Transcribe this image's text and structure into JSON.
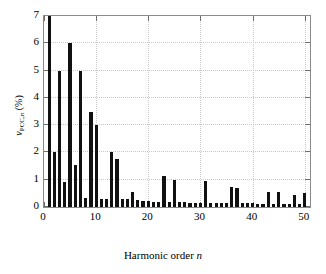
{
  "chart_data": {
    "type": "bar",
    "title": "",
    "xlabel_main": "Harmonic order",
    "xlabel_italic": "n",
    "ylabel_main": "v",
    "ylabel_sub": "PCC,",
    "ylabel_sub_italic": "n",
    "ylabel_unit": "(%)",
    "xlim": [
      0,
      51
    ],
    "ylim": [
      0,
      7
    ],
    "grid": true,
    "legend": null,
    "bar_color": "#111111",
    "xticks": [
      0,
      10,
      20,
      30,
      40,
      50
    ],
    "xtick_labels": [
      "0",
      "10",
      "20",
      "30",
      "40",
      "50"
    ],
    "yticks": [
      0,
      1,
      2,
      3,
      4,
      5,
      6,
      7
    ],
    "ytick_labels": [
      "0",
      "1",
      "2",
      "3",
      "4",
      "5",
      "6",
      "7"
    ],
    "x": [
      1,
      2,
      3,
      4,
      5,
      6,
      7,
      8,
      9,
      10,
      11,
      12,
      13,
      14,
      15,
      16,
      17,
      18,
      19,
      20,
      21,
      22,
      23,
      24,
      25,
      26,
      27,
      28,
      29,
      30,
      31,
      32,
      33,
      34,
      35,
      36,
      37,
      38,
      39,
      40,
      41,
      42,
      43,
      44,
      45,
      46,
      47,
      48,
      49,
      50
    ],
    "values": [
      7.0,
      2.0,
      5.0,
      0.9,
      6.0,
      1.55,
      5.0,
      0.32,
      3.5,
      3.0,
      0.28,
      0.3,
      2.0,
      1.75,
      0.3,
      0.28,
      0.55,
      0.25,
      0.22,
      0.22,
      0.2,
      0.2,
      1.15,
      0.2,
      1.0,
      0.18,
      0.18,
      0.15,
      0.15,
      0.15,
      0.95,
      0.15,
      0.15,
      0.15,
      0.15,
      0.75,
      0.7,
      0.15,
      0.15,
      0.15,
      0.12,
      0.12,
      0.55,
      0.12,
      0.55,
      0.12,
      0.12,
      0.45,
      0.12,
      0.5
    ],
    "note_clipped_first_bar": "bar at n=1 reaches the top of the axis (7)"
  },
  "axis": {
    "x_title": "Harmonic order n",
    "y_title": "vPCC,n (%)"
  }
}
